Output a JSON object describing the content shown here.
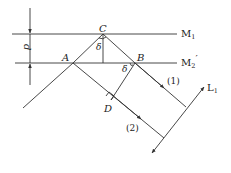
{
  "diagram": {
    "type": "optical path diagram (Michelson interferometer equivalent air film)",
    "labels": {
      "mirror1": "M",
      "mirror1_sub": "1",
      "mirror2": "M",
      "mirror2_sub": "2",
      "mirror2_prime": "′",
      "thickness": "d",
      "point_a": "A",
      "point_b": "B",
      "point_c": "C",
      "point_d": "D",
      "angle_c": "δ",
      "angle_b": "δ",
      "ray1": "(1)",
      "ray2": "(2)",
      "lens": "L",
      "lens_sub": "1"
    },
    "colors": {
      "line": "#333333",
      "text": "#222222",
      "background": "#ffffff"
    }
  }
}
